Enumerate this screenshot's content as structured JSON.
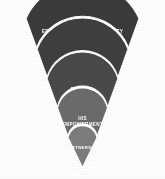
{
  "diagram": {
    "type": "funnel-wedge",
    "title": "",
    "orientation": "bottom-up",
    "background_color": "#ffffff",
    "direction_note": "arrows point upward between bands",
    "bands": [
      {
        "index": 0,
        "position": "top",
        "label": "EFFECTIVENESS + CREDIBILITY",
        "label_lines": [
          "EFFECTIVENESS + CREDIBILITY"
        ],
        "color": "#3b3b3b",
        "width_rank": 5
      },
      {
        "index": 1,
        "position": "second",
        "label": "HEIGHTENED ABILITY",
        "label_lines": [
          "HEIGHTENED",
          "ABILITY"
        ],
        "color": "#3f3f3f",
        "width_rank": 4
      },
      {
        "index": 2,
        "position": "third",
        "label": "RESTFUL CONFIDENCE",
        "label_lines": [
          "RESTFUL",
          "CONFIDENCE"
        ],
        "color": "#4a4a4a",
        "width_rank": 3
      },
      {
        "index": 3,
        "position": "fourth",
        "label": "HIS EMPOWERMENT",
        "label_lines": [
          "HIS",
          "EMPOWERMENT"
        ],
        "color": "#6b6b6b",
        "width_rank": 2
      },
      {
        "index": 4,
        "position": "bottom",
        "label": "PARTNERSHIP",
        "label_lines": [
          "PARTNERSHIP"
        ],
        "color": "#7d7d7d",
        "width_rank": 1
      }
    ],
    "arrows": [
      {
        "index": 0,
        "between": "HEIGHTENED ABILITY -> EFFECTIVENESS + CREDIBILITY",
        "glyph": "arrow-up-icon"
      },
      {
        "index": 1,
        "between": "RESTFUL CONFIDENCE -> HEIGHTENED ABILITY",
        "glyph": "arrow-up-icon"
      },
      {
        "index": 2,
        "between": "HIS EMPOWERMENT -> RESTFUL CONFIDENCE",
        "glyph": "arrow-up-icon"
      },
      {
        "index": 3,
        "between": "PARTNERSHIP -> HIS EMPOWERMENT",
        "glyph": "arrow-up-icon"
      }
    ]
  }
}
